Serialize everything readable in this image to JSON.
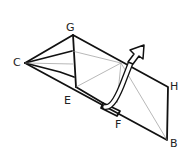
{
  "diagram": {
    "type": "origami-fold",
    "labels": {
      "C": "C",
      "G": "G",
      "E": "E",
      "F": "F",
      "H": "H",
      "B": "B"
    },
    "colors": {
      "line": "#111111",
      "crease": "#888888",
      "background": "#ffffff"
    },
    "arrow": "fold-up-arrow"
  }
}
